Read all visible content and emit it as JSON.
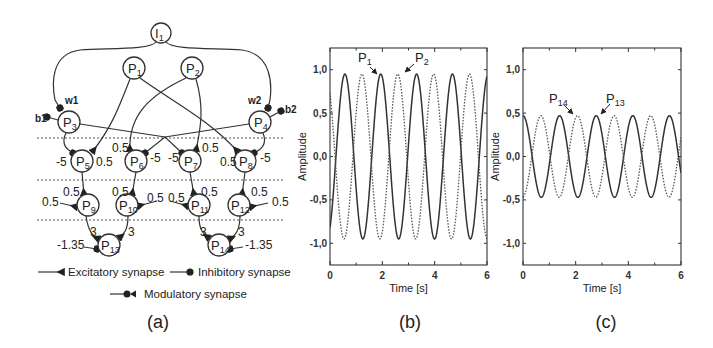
{
  "panels": {
    "a": {
      "label": "(a)",
      "nodes": [
        {
          "id": "I1",
          "main": "I",
          "sub": "1",
          "x": 161,
          "y": 33
        },
        {
          "id": "P1",
          "main": "P",
          "sub": "1",
          "x": 134,
          "y": 68
        },
        {
          "id": "P2",
          "main": "P",
          "sub": "2",
          "x": 192,
          "y": 68
        },
        {
          "id": "P3",
          "main": "P",
          "sub": "3",
          "x": 69,
          "y": 122
        },
        {
          "id": "P4",
          "main": "P",
          "sub": "4",
          "x": 260,
          "y": 122
        },
        {
          "id": "P5",
          "main": "P",
          "sub": "5",
          "x": 82,
          "y": 161
        },
        {
          "id": "P6",
          "main": "P",
          "sub": "6",
          "x": 136,
          "y": 161
        },
        {
          "id": "P7",
          "main": "P",
          "sub": "7",
          "x": 190,
          "y": 161
        },
        {
          "id": "P8",
          "main": "P",
          "sub": "8",
          "x": 245,
          "y": 161
        },
        {
          "id": "P9",
          "main": "P",
          "sub": "9",
          "x": 88,
          "y": 205
        },
        {
          "id": "P10",
          "main": "P",
          "sub": "10",
          "x": 127,
          "y": 205
        },
        {
          "id": "P11",
          "main": "P",
          "sub": "11",
          "x": 199,
          "y": 205
        },
        {
          "id": "P12",
          "main": "P",
          "sub": "12",
          "x": 239,
          "y": 205
        },
        {
          "id": "P13",
          "main": "P",
          "sub": "13",
          "x": 109,
          "y": 245
        },
        {
          "id": "P14",
          "main": "P",
          "sub": "14",
          "x": 219,
          "y": 245
        }
      ],
      "weights": [
        {
          "text": "w1",
          "x": 65,
          "y": 104,
          "cls": "smalllab"
        },
        {
          "text": "b1",
          "x": 35,
          "y": 122,
          "cls": "smalllab"
        },
        {
          "text": "w2",
          "x": 248,
          "y": 104,
          "cls": "smalllab"
        },
        {
          "text": "b2",
          "x": 285,
          "y": 113,
          "cls": "smalllab"
        },
        {
          "text": "-5",
          "x": 56,
          "y": 166,
          "cls": "wlabel"
        },
        {
          "text": "0.5",
          "x": 96,
          "y": 166,
          "cls": "wlabel"
        },
        {
          "text": "0.5",
          "x": 112,
          "y": 152,
          "cls": "wlabel"
        },
        {
          "text": "-5",
          "x": 150,
          "y": 162,
          "cls": "wlabel"
        },
        {
          "text": "-5",
          "x": 168,
          "y": 162,
          "cls": "wlabel"
        },
        {
          "text": "0.5",
          "x": 202,
          "y": 152,
          "cls": "wlabel"
        },
        {
          "text": "0.5",
          "x": 220,
          "y": 166,
          "cls": "wlabel"
        },
        {
          "text": "-5",
          "x": 260,
          "y": 162,
          "cls": "wlabel"
        },
        {
          "text": "0.5",
          "x": 63,
          "y": 196,
          "cls": "wlabel"
        },
        {
          "text": "0.5",
          "x": 42,
          "y": 206,
          "cls": "wlabel"
        },
        {
          "text": "0.5",
          "x": 112,
          "y": 196,
          "cls": "wlabel"
        },
        {
          "text": "0.5",
          "x": 147,
          "y": 202,
          "cls": "wlabel"
        },
        {
          "text": "0.5",
          "x": 168,
          "y": 202,
          "cls": "wlabel"
        },
        {
          "text": "0.5",
          "x": 201,
          "y": 196,
          "cls": "wlabel"
        },
        {
          "text": "0.5",
          "x": 251,
          "y": 196,
          "cls": "wlabel"
        },
        {
          "text": "0.5",
          "x": 272,
          "y": 206,
          "cls": "wlabel"
        },
        {
          "text": "3",
          "x": 90,
          "y": 236,
          "cls": "wlabel"
        },
        {
          "text": "3",
          "x": 128,
          "y": 236,
          "cls": "wlabel"
        },
        {
          "text": "3",
          "x": 200,
          "y": 236,
          "cls": "wlabel"
        },
        {
          "text": "3",
          "x": 238,
          "y": 236,
          "cls": "wlabel"
        },
        {
          "text": "-1.35",
          "x": 57,
          "y": 249,
          "cls": "wlabel"
        },
        {
          "text": "-1.35",
          "x": 245,
          "y": 249,
          "cls": "wlabel"
        }
      ],
      "legend": {
        "excitatory": "Excitatory synapse",
        "inhibitory": "Inhibitory  synapse",
        "modulatory": "Modulatory synapse"
      }
    },
    "b": {
      "label": "(b)",
      "ann1": {
        "main": "P",
        "sub": "1"
      },
      "ann2": {
        "main": "P",
        "sub": "2"
      }
    },
    "c": {
      "label": "(c)",
      "ann1": {
        "main": "P",
        "sub": "14"
      },
      "ann2": {
        "main": "P",
        "sub": "13"
      }
    }
  },
  "chart_data": [
    {
      "type": "line",
      "panel": "(b)",
      "title": "",
      "xlabel": "Time [s]",
      "ylabel": "Amplitude",
      "xlim": [
        0,
        6
      ],
      "ylim": [
        -1.25,
        1.25
      ],
      "xticks": [
        "0",
        "2",
        "4",
        "6"
      ],
      "yticks": [
        "1,0",
        "0,5",
        "0,0",
        "-0,5",
        "-1,0"
      ],
      "grid": false,
      "annotations": [
        "P1",
        "P2"
      ],
      "series": [
        {
          "name": "P1",
          "style": "solid",
          "amplitude": 0.95,
          "period_s": 1.37,
          "peak_times_s": [
            0.57,
            1.91,
            3.28,
            4.66,
            6.0
          ]
        },
        {
          "name": "P2",
          "style": "dotted",
          "amplitude": 0.95,
          "period_s": 1.37,
          "peak_times_s": [
            1.22,
            2.6,
            3.97,
            5.34
          ]
        }
      ]
    },
    {
      "type": "line",
      "panel": "(c)",
      "title": "",
      "xlabel": "Time [s]",
      "ylabel": "Amplitude",
      "xlim": [
        0,
        6
      ],
      "ylim": [
        -1.25,
        1.25
      ],
      "xticks": [
        "0",
        "2",
        "4",
        "6"
      ],
      "yticks": [
        "1,0",
        "0,5",
        "0,0",
        "-0,5",
        "-1,0"
      ],
      "grid": false,
      "annotations": [
        "P14",
        "P13"
      ],
      "series": [
        {
          "name": "P13",
          "style": "solid",
          "amplitude": 0.47,
          "period_s": 1.39,
          "peak_times_s": [
            0.0,
            1.37,
            2.78,
            4.18,
            5.56
          ]
        },
        {
          "name": "P14",
          "style": "dotted",
          "amplitude": 0.47,
          "period_s": 1.39,
          "peak_times_s": [
            0.68,
            2.05,
            3.46,
            4.87
          ]
        }
      ]
    }
  ]
}
